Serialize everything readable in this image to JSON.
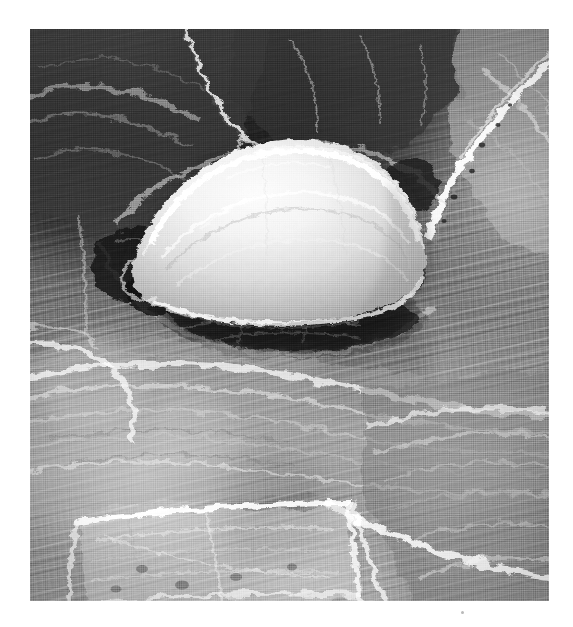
{
  "page": {
    "width": 573,
    "height": 627,
    "background_color": "#ffffff",
    "media_type": "scanned halftone photographic plate"
  },
  "figure": {
    "name": "sem-micrograph",
    "modality": "scanning electron micrograph",
    "color_mode": "grayscale",
    "plate": {
      "left": 30,
      "top": 29,
      "width": 519,
      "height": 572
    },
    "tone": {
      "darkest": "#2a2a2a",
      "dark_mid": "#4e4e4e",
      "mid": "#7d7d7d",
      "light_mid": "#b4b4b4",
      "highlight": "#f2f2f2",
      "paper": "#ffffff"
    },
    "regions": [
      {
        "name": "upper-left-epithelial-cell",
        "description": "large dark polygonal cell with faint fibrous ridges running upper-left to lower-right",
        "tone": "dark"
      },
      {
        "name": "upper-center-epithelial-cell",
        "description": "dark granular cell surface bounded below by the depression rim",
        "tone": "dark"
      },
      {
        "name": "upper-right-epithelial-cell",
        "description": "mid-tone cell separated by a bright raised boundary ridge running to the top-right corner",
        "tone": "mid"
      },
      {
        "name": "central-rounded-cell",
        "description": "bright dome-shaped cell with smooth ruffled membrane sitting in a shallow pit",
        "tone": "highlight"
      },
      {
        "name": "sub-cell-shadow-cavity",
        "description": "dark elongated shadow beneath the rounded cell where it lifts off the surface",
        "tone": "darkest"
      },
      {
        "name": "left-shadow-pocket",
        "description": "dark irregular opening at the lower-left base of the rounded cell",
        "tone": "darkest"
      },
      {
        "name": "lower-central-epithelial-cell",
        "description": "broad mid-tone cell with strong horizontal fibrous striations and bright crests",
        "tone": "light_mid"
      },
      {
        "name": "lower-left-rectangular-cell",
        "description": "bright rectangular cell outlined by raised light borders, coarse fibrous interior",
        "tone": "light_mid"
      },
      {
        "name": "lower-right-epithelial-cell",
        "description": "mid-dark cell with diagonal ridges sweeping toward the lower-right corner",
        "tone": "mid"
      }
    ],
    "features": [
      {
        "name": "cell-boundary-crack",
        "description": "fine bright fracture line descending from the top edge to the depression rim"
      },
      {
        "name": "raised-boundary-ridge",
        "description": "bright raised junction separating adjacent epithelial cells"
      },
      {
        "name": "membrane-ruffle",
        "description": "curved highlight folds across the dome of the rounded cell"
      },
      {
        "name": "pore-openings",
        "description": "small dark punctate openings along the right boundary ridge"
      }
    ],
    "artifacts": [
      {
        "name": "scan-speck",
        "description": "small dark speck on the white margin below the plate",
        "x": 462,
        "y": 612
      }
    ],
    "annotations": {
      "has_text_labels": false,
      "has_scale_bar": false,
      "caption": ""
    }
  }
}
